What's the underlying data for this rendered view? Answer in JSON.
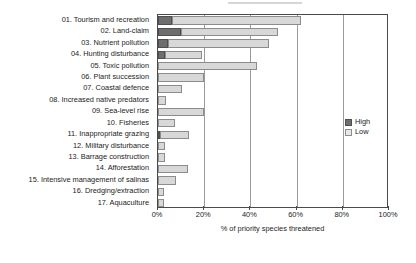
{
  "chart_data": {
    "type": "bar",
    "orientation": "horizontal",
    "stacked": true,
    "title": "",
    "xlabel": "% of priority species threatened",
    "ylabel": "",
    "xlim": [
      0,
      100
    ],
    "xticks": [
      "0%",
      "20%",
      "40%",
      "60%",
      "80%",
      "100%"
    ],
    "xtick_values": [
      0,
      20,
      40,
      60,
      80,
      100
    ],
    "grid": "vertical",
    "legend_position": "right-middle",
    "categories": [
      "01. Tourism and recreation",
      "02. Land-claim",
      "03. Nutrient pollution",
      "04. Hunting disturbance",
      "05. Toxic pollution",
      "06. Plant succession",
      "07. Coastal defence",
      "08. Increased native predators",
      "09. Sea-level rise",
      "10. Fisheries",
      "11. Inappropriate grazing",
      "12. Military disturbance",
      "13. Barrage construction",
      "14. Afforestation",
      "15. Intensive management of salinas",
      "16. Dredging/extraction",
      "17. Aquaculture"
    ],
    "series": [
      {
        "name": "High",
        "color": "#6e6e6e",
        "values": [
          6,
          10,
          4.5,
          3,
          0,
          0,
          0,
          0,
          0,
          0,
          1,
          0,
          0,
          0,
          0,
          0,
          0
        ]
      },
      {
        "name": "Low",
        "color": "#d8d8d8",
        "values": [
          56,
          42,
          43.5,
          16,
          43,
          20,
          10.5,
          3.5,
          20,
          7.5,
          12.5,
          3,
          3,
          13,
          8,
          2.5,
          2.5
        ]
      }
    ],
    "totals": [
      62,
      52,
      48,
      19,
      43,
      20,
      10.5,
      3.5,
      20,
      7.5,
      13.5,
      3,
      3,
      13,
      8,
      2.5,
      2.5
    ]
  },
  "legend": {
    "entries": [
      {
        "label": "High",
        "swatch": "high-swatch"
      },
      {
        "label": "Low",
        "swatch": "low-swatch"
      }
    ]
  }
}
